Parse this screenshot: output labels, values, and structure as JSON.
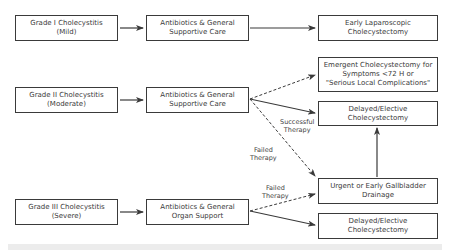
{
  "diagram": {
    "grades": [
      {
        "lines": [
          "Grade I Cholecystitis",
          "(Mild)"
        ]
      },
      {
        "lines": [
          "Grade II  Cholecystitis",
          "(Moderate)"
        ]
      },
      {
        "lines": [
          "Grade III Cholecystitis",
          "(Severe)"
        ]
      }
    ],
    "treatments": [
      {
        "lines": [
          "Antibiotics & General",
          "Supportive Care"
        ]
      },
      {
        "lines": [
          "Antibiotics & General",
          "Supportive Care"
        ]
      },
      {
        "lines": [
          "Antibiotics & General",
          "Organ Support"
        ]
      }
    ],
    "outcomes": {
      "early_lap": {
        "lines": [
          "Early Laparoscopic",
          "Cholecystectomy"
        ]
      },
      "emergent": {
        "lines": [
          "Emergent Cholecystectomy for",
          "Symptoms <72 H or",
          "\"Serious Local Complications\""
        ]
      },
      "delayed_1": {
        "lines": [
          "Delayed/Elective",
          "Cholecystectomy"
        ]
      },
      "urgent_drainage": {
        "lines": [
          "Urgent or Early Gallbladder",
          "Drainage"
        ]
      },
      "delayed_2": {
        "lines": [
          "Delayed/Elective",
          "Cholecystectomy"
        ]
      }
    },
    "edge_labels": {
      "successful": [
        "Successful",
        "Therapy"
      ],
      "failed_moderate": [
        "Failed",
        "Therapy"
      ],
      "failed_severe": [
        "Failed",
        "Therapy"
      ]
    },
    "colors": {
      "line": "#3a3a3a",
      "box_border": "#3a3a3a",
      "text": "#3a3a3a",
      "footer_band": "#ececec"
    }
  }
}
